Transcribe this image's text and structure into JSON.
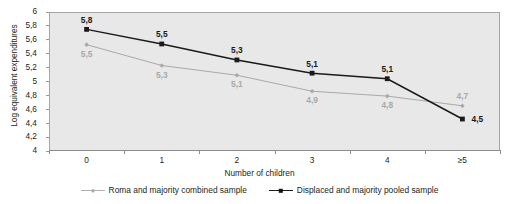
{
  "chart_data": {
    "type": "line",
    "title": "",
    "xlabel": "Number of children",
    "ylabel": "Log equivalent expenditures",
    "categories": [
      "0",
      "1",
      "2",
      "3",
      "4",
      "≥5"
    ],
    "ylim": [
      4,
      6
    ],
    "ytick_labels": [
      "6",
      "5,8",
      "5,6",
      "5,4",
      "5,2",
      "5",
      "4,8",
      "4,6",
      "4,4",
      "4,2",
      "4"
    ],
    "ytick_values": [
      6,
      5.8,
      5.6,
      5.4,
      5.2,
      5.0,
      4.8,
      4.6,
      4.4,
      4.2,
      4.0
    ],
    "grid": false,
    "legend_position": "bottom",
    "plot_background": "#e8e8e8",
    "series": [
      {
        "name": "Roma and majority combined sample",
        "color": "#a9a9a9",
        "marker": "diamond",
        "values": [
          5.53,
          5.23,
          5.09,
          4.86,
          4.79,
          4.65
        ],
        "point_labels": [
          "5,5",
          "5,3",
          "5,1",
          "4,9",
          "4,8",
          "4,7"
        ],
        "label_positions": [
          "below",
          "below",
          "below",
          "below",
          "below",
          "above"
        ]
      },
      {
        "name": "Displaced and majority pooled sample",
        "color": "#1a1a1a",
        "marker": "square",
        "values": [
          5.75,
          5.54,
          5.31,
          5.12,
          5.04,
          4.46
        ],
        "point_labels": [
          "5,8",
          "5,5",
          "5,3",
          "5,1",
          "5,1",
          "4,5"
        ],
        "label_positions": [
          "above",
          "above",
          "above",
          "above",
          "above",
          "right"
        ]
      }
    ]
  },
  "axes": {
    "y_title": "Log equivalent expenditures",
    "x_title": "Number of children"
  },
  "legend": {
    "items": [
      {
        "label": "Roma and majority combined sample",
        "marker": "diamond-marker",
        "color": "#a9a9a9"
      },
      {
        "label": "Displaced and majority pooled sample",
        "marker": "square-marker",
        "color": "#1a1a1a"
      }
    ]
  }
}
